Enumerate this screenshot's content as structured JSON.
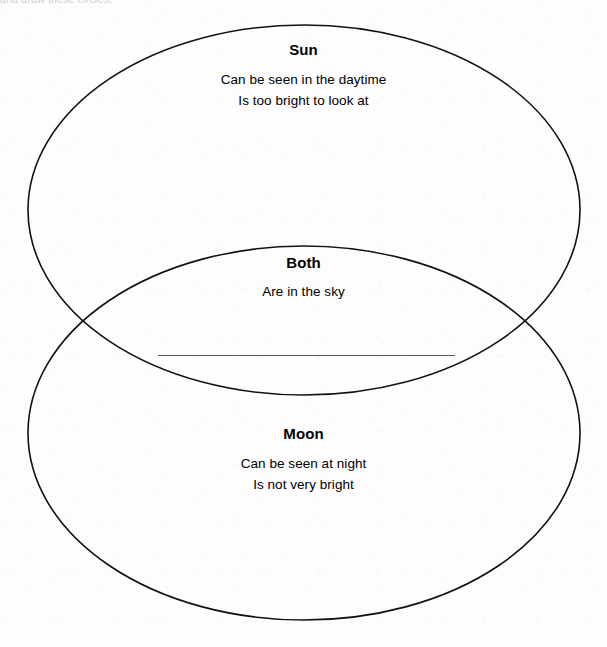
{
  "page": {
    "top_instruction_clipped": "and draw these circles.",
    "background_color": "#fdfdfd",
    "ink_color": "#000000"
  },
  "diagram": {
    "type": "venn-2-set",
    "stroke_color": "#111111",
    "stroke_width": 1.6,
    "sets": [
      {
        "id": "sun",
        "title": "Sun",
        "lines": [
          "Can be seen in the daytime",
          "Is too bright to look at"
        ],
        "ellipse": {
          "cx": 304,
          "cy": 210,
          "rx": 276,
          "ry": 185
        }
      },
      {
        "id": "moon",
        "title": "Moon",
        "lines": [
          "Can be seen at night",
          "Is not very bright"
        ],
        "ellipse": {
          "cx": 304,
          "cy": 433,
          "rx": 276,
          "ry": 187
        }
      }
    ],
    "intersection": {
      "id": "both",
      "title": "Both",
      "lines": [
        "Are in the sky"
      ],
      "blank_answer_line": {
        "x1": 158,
        "y1": 356,
        "x2": 455,
        "y2": 356
      },
      "crossing_points": [
        {
          "x": 73,
          "y": 327
        },
        {
          "x": 534,
          "y": 327
        }
      ]
    }
  }
}
